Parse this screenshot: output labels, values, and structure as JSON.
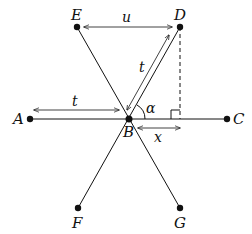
{
  "points": {
    "A": {
      "label": "A",
      "x": 30,
      "y": 119
    },
    "B": {
      "label": "B",
      "x": 129,
      "y": 119
    },
    "C": {
      "label": "C",
      "x": 227,
      "y": 119
    },
    "D": {
      "label": "D",
      "x": 180,
      "y": 27
    },
    "E": {
      "label": "E",
      "x": 77,
      "y": 27
    },
    "F": {
      "label": "F",
      "x": 78,
      "y": 208
    },
    "G": {
      "label": "G",
      "x": 180,
      "y": 208
    }
  },
  "measures": {
    "u": "u",
    "t_horizontal": "t",
    "t_diagonal": "t",
    "x": "x",
    "angle": "α"
  },
  "colors": {
    "stroke": "#111111"
  }
}
